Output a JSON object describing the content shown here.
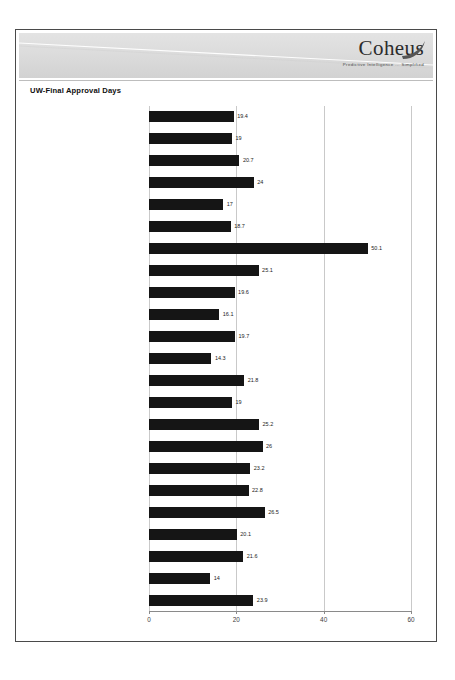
{
  "header": {
    "logo_word": "Coheus",
    "logo_tagline": "Predictive Intelligence ... Simplified",
    "swoosh_icon": "diagonal-swoosh",
    "flourish_icon": "leaf-flourish-icon"
  },
  "report": {
    "title": "UW-Final Approval Days"
  },
  "chart_data": {
    "type": "bar",
    "orientation": "horizontal",
    "title": "UW-Final Approval Days",
    "xlabel": "",
    "ylabel": "",
    "xlim": [
      0,
      60
    ],
    "xticks": [
      0,
      20,
      40,
      60
    ],
    "xtick_labels": [
      "0",
      "20",
      "40",
      "60"
    ],
    "grid": true,
    "grid_axis": "x",
    "legend": "none",
    "bar_color": "#151515",
    "categories": [
      "Audra Whitney",
      "Betsy Hopper",
      "Bettie Gordon",
      "Burton Clark",
      "Clark Daniels",
      "Cleo Alec Hanson",
      "Cleo Dominguez",
      "Cyrus Weeks",
      "Fannie Howard",
      "Genaro Giles Vang",
      "Hillary Burnett",
      "Jeannette Odom",
      "Josephine Howe",
      "Julian Holt",
      "Melvin D Dodson",
      "Mollie Christian",
      "Nettie D Burns",
      "Nora Sykes",
      "Noreen Liza Hester",
      "Olive Silva",
      "Rosendo Matthews",
      "Tracey Cooley",
      "Wendi Anderson"
    ],
    "values": [
      19.4,
      19,
      20.7,
      24,
      17,
      18.7,
      50.1,
      25.1,
      19.6,
      16.1,
      19.7,
      14.3,
      21.8,
      19,
      25.2,
      26,
      23.2,
      22.8,
      26.5,
      20.1,
      21.6,
      14,
      23.9
    ],
    "value_labels": [
      "19.4",
      "19",
      "20.7",
      "24",
      "17",
      "18.7",
      "50.1",
      "25.1",
      "19.6",
      "16.1",
      "19.7",
      "14.3",
      "21.8",
      "19",
      "25.2",
      "26",
      "23.2",
      "22.8",
      "26.5",
      "20.1",
      "21.6",
      "14",
      "23.9"
    ]
  }
}
